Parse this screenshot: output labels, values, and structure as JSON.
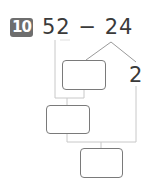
{
  "problem": {
    "number": "10",
    "expression": "52 − 24",
    "minuend": "52",
    "operator": "−",
    "subtrahend": "24"
  },
  "decomposition": {
    "split_value": "2",
    "answer_boxes": [
      "",
      "",
      ""
    ]
  },
  "colors": {
    "badge_bg": "#6e6e6e",
    "text": "#3a3a3a",
    "box_border": "#7a7a7a",
    "line_dark": "#9a9a9a",
    "line_light": "#c8c8c8"
  }
}
